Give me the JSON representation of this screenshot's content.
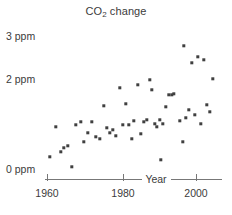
{
  "chart_data": {
    "type": "scatter",
    "title": "CO2 change",
    "title_parts": {
      "prefix": "CO",
      "subscript": "2",
      "suffix": " change"
    },
    "xlabel": "Year",
    "ylabel": "",
    "xlim": [
      1956,
      2012
    ],
    "ylim": [
      0,
      3.25
    ],
    "xticks": [
      1960,
      1980,
      2000
    ],
    "xtick_labels": [
      "1960",
      "1980",
      "2000"
    ],
    "yticks": [
      0,
      2,
      3
    ],
    "ytick_labels": [
      "0 ppm",
      "2 ppm",
      "3 ppm"
    ],
    "grid": false,
    "legend": "none",
    "marker": "square",
    "marker_color": "#404040",
    "axis_color": "#777777",
    "text_color": "#3b3b3b",
    "background": "#ffffff",
    "x": [
      1959,
      1960,
      1961,
      1962,
      1963,
      1964,
      1965,
      1966,
      1967,
      1968,
      1969,
      1970,
      1971,
      1972,
      1973,
      1974,
      1975,
      1976,
      1977,
      1978,
      1979,
      1980,
      1981,
      1982,
      1983,
      1984,
      1985,
      1986,
      1987,
      1988,
      1989,
      1990,
      1991,
      1992,
      1993,
      1994,
      1995,
      1996,
      1997,
      1998,
      1999,
      2000,
      2001,
      2002,
      2003,
      2004,
      2005,
      2006,
      2007,
      2008,
      2009,
      2010
    ],
    "values": [
      0.96,
      0.31,
      0.7,
      0.49,
      0.67,
      0.14,
      1.0,
      1.21,
      0.72,
      0.99,
      1.32,
      1.05,
      0.8,
      1.73,
      1.26,
      0.91,
      1.08,
      0.89,
      2.09,
      1.36,
      1.72,
      1.32,
      1.18,
      1.37,
      2.23,
      1.02,
      1.35,
      1.4,
      2.33,
      2.11,
      1.31,
      1.25,
      1.26,
      0.5,
      1.22,
      1.67,
      1.94,
      1.99,
      1.96,
      2.96,
      1.32,
      0.85,
      1.6,
      1.53,
      2.33,
      1.55,
      2.52,
      1.4,
      2.59,
      1.72,
      1.51,
      2.05
    ],
    "points_px": [
      [
        56,
        127
      ],
      [
        50,
        157
      ],
      [
        61,
        152
      ],
      [
        64,
        148
      ],
      [
        68,
        146
      ],
      [
        72,
        167
      ],
      [
        76,
        125
      ],
      [
        81,
        122
      ],
      [
        84,
        142
      ],
      [
        88,
        133
      ],
      [
        92,
        122
      ],
      [
        96,
        137
      ],
      [
        100,
        139
      ],
      [
        104,
        106
      ],
      [
        107,
        128
      ],
      [
        110,
        133
      ],
      [
        113,
        130
      ],
      [
        116,
        136
      ],
      [
        120,
        88
      ],
      [
        123,
        125
      ],
      [
        126,
        104
      ],
      [
        129,
        125
      ],
      [
        132,
        139
      ],
      [
        134,
        121
      ],
      [
        138,
        85
      ],
      [
        141,
        134
      ],
      [
        144,
        122
      ],
      [
        147,
        120
      ],
      [
        150,
        80
      ],
      [
        152,
        90
      ],
      [
        155,
        124
      ],
      [
        157,
        127
      ],
      [
        160,
        120
      ],
      [
        161,
        160
      ],
      [
        163,
        124
      ],
      [
        166,
        107
      ],
      [
        169,
        95
      ],
      [
        172,
        95
      ],
      [
        174,
        94
      ],
      [
        184,
        46
      ],
      [
        180,
        121
      ],
      [
        183,
        142
      ],
      [
        186,
        118
      ],
      [
        189,
        110
      ],
      [
        192,
        63
      ],
      [
        195,
        115
      ],
      [
        198,
        57
      ],
      [
        201,
        124
      ],
      [
        204,
        60
      ],
      [
        207,
        105
      ],
      [
        210,
        112
      ],
      [
        213,
        79
      ]
    ],
    "annotations": []
  },
  "axis": {
    "xaxis_title": "Year",
    "ytick_3": "3 ppm",
    "ytick_2": "2 ppm",
    "ytick_0": "0 ppm",
    "xtick_1960": "1960",
    "xtick_1980": "1980",
    "xtick_2000": "2000"
  },
  "title": {
    "prefix": "CO",
    "subscript": "2",
    "suffix": " change"
  }
}
